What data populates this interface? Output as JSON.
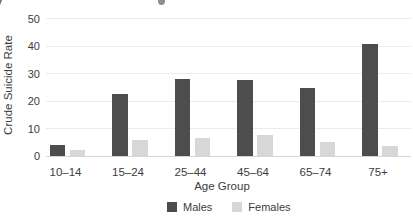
{
  "axes": {
    "x_title": "Age Group",
    "y_title": "Crude Suicide Rate"
  },
  "chart_data": {
    "type": "bar",
    "title": "",
    "categories": [
      "10–14",
      "15–24",
      "25–44",
      "45–64",
      "65–74",
      "75+"
    ],
    "series": [
      {
        "name": "Males",
        "color": "#4d4d4d",
        "values": [
          4,
          22.5,
          28,
          27.5,
          24.5,
          40.5
        ]
      },
      {
        "name": "Females",
        "color": "#d7d7d7",
        "values": [
          2,
          5.5,
          6.5,
          7.5,
          5,
          3.5
        ]
      }
    ],
    "xlabel": "Age Group",
    "ylabel": "Crude Suicide Rate",
    "ylim": [
      0,
      50
    ],
    "yticks": [
      0,
      10,
      20,
      30,
      40,
      50
    ],
    "grid": true,
    "legend_position": "bottom"
  }
}
